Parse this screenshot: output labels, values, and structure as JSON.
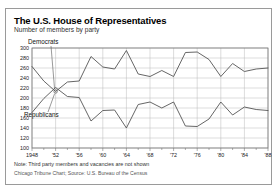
{
  "title": "The U.S. House of Representatives",
  "subtitle": "Number of members by party",
  "note": "Note: Third party members and vacancies are not shown",
  "source": "Chicago Tribune Chart; Source: U.S. Bureau of the Census",
  "colors": {
    "line": "#555555",
    "grid": "#b8b8b8",
    "axis": "#777777",
    "frame": "#9a9a9a",
    "text": "#111111"
  },
  "labels": {
    "democrats": "Democrats",
    "republicans": "Republicans"
  },
  "chart_data": {
    "type": "line",
    "title": "The U.S. House of Representatives",
    "subtitle": "Number of members by party",
    "xlabel": "",
    "ylabel": "Number of members by party",
    "xlim": [
      1948,
      1988
    ],
    "ylim": [
      100,
      300
    ],
    "yticks": [
      100,
      120,
      140,
      160,
      180,
      200,
      220,
      240,
      260,
      280,
      300
    ],
    "xticks": [
      1948,
      1950,
      1952,
      1954,
      1956,
      1958,
      1960,
      1962,
      1964,
      1966,
      1968,
      1970,
      1972,
      1974,
      1976,
      1978,
      1980,
      1982,
      1984,
      1986,
      1988
    ],
    "xtick_labels": [
      "1948",
      "",
      "'52",
      "",
      "'56",
      "",
      "'60",
      "",
      "'64",
      "",
      "'68",
      "",
      "'72",
      "",
      "'76",
      "",
      "'80",
      "",
      "'84",
      "",
      "'88"
    ],
    "grid": true,
    "legend": "inline-annotations",
    "x": [
      1948,
      1950,
      1952,
      1954,
      1956,
      1958,
      1960,
      1962,
      1964,
      1966,
      1968,
      1970,
      1972,
      1974,
      1976,
      1978,
      1980,
      1982,
      1984,
      1986,
      1988
    ],
    "series": [
      {
        "name": "Democrats",
        "values": [
          263,
          234,
          213,
          232,
          234,
          283,
          262,
          258,
          295,
          248,
          243,
          255,
          243,
          291,
          292,
          277,
          243,
          269,
          253,
          258,
          260
        ]
      },
      {
        "name": "Republicans",
        "values": [
          171,
          199,
          221,
          203,
          201,
          154,
          175,
          176,
          140,
          187,
          192,
          180,
          192,
          144,
          143,
          158,
          192,
          166,
          182,
          177,
          175
        ]
      }
    ]
  }
}
